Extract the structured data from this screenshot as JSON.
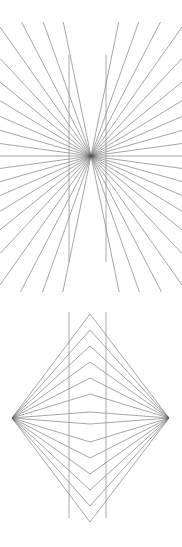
{
  "page": {
    "background_color": "#ffffff",
    "width": 182,
    "height": 547,
    "figure_count": 2
  },
  "style": {
    "ray_color": "#5a5a5a",
    "vertical_line_color": "#8d8d8d",
    "ray_stroke_width": 0.55,
    "vertical_stroke_width": 0.75
  },
  "chart_data": [
    {
      "type": "line",
      "title": "Hering illusion (radiating rays with two vertical lines)",
      "xlabel": "",
      "ylabel": "",
      "xlim": [
        0,
        182
      ],
      "ylim": [
        20,
        292
      ],
      "grid": false,
      "legend": "none",
      "vertex": {
        "x": 91,
        "y": 156
      },
      "vertical_lines": [
        {
          "name": "left-vertical",
          "x": 69,
          "y_top": 55,
          "y_bottom": 262
        },
        {
          "name": "right-vertical",
          "x": 106,
          "y_top": 55,
          "y_bottom": 262
        }
      ],
      "ray_count": 46,
      "ray_half_count": 23,
      "ray_angles_deg": [
        0,
        7.8,
        15.7,
        23.5,
        31.3,
        39.1,
        47.0,
        54.8,
        62.6,
        70.4,
        78.3,
        -7.8,
        -15.7,
        -23.5,
        -31.3,
        -39.1,
        -47.0,
        -54.8,
        -62.6,
        -70.4,
        -78.3
      ],
      "ray_extent": {
        "x_min": 0,
        "x_max": 182,
        "y_min": 22,
        "y_max": 292
      }
    },
    {
      "type": "line",
      "title": "Chevron illusion (nested chevrons between two apex points)",
      "xlabel": "",
      "ylabel": "",
      "xlim": [
        0,
        182
      ],
      "ylim": [
        310,
        527
      ],
      "grid": false,
      "legend": "none",
      "left_apex": {
        "x": 12,
        "y": 418
      },
      "right_apex": {
        "x": 169,
        "y": 418
      },
      "vertical_lines": [
        {
          "name": "left-vertical",
          "x": 69,
          "y_top": 312,
          "y_bottom": 518
        },
        {
          "name": "right-vertical",
          "x": 106,
          "y_top": 312,
          "y_bottom": 518
        }
      ],
      "chevron_count": 13,
      "chevron_mid_x": 90,
      "chevron_apex_offsets": [
        -104,
        -88,
        -72,
        -56,
        -40,
        -24,
        -8,
        8,
        24,
        40,
        56,
        72,
        88,
        104
      ],
      "chevron_mid_y_values": [
        314,
        330,
        346,
        362,
        378,
        394,
        412,
        424,
        442,
        458,
        474,
        490,
        506,
        522
      ]
    }
  ]
}
